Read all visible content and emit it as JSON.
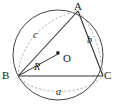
{
  "figure": {
    "type": "geometry-diagram",
    "background_color": "#ffffff",
    "stroke_color": "#3a3a3a",
    "dashed_color": "#9a9a9a",
    "text_color": "#1a1a1a"
  },
  "labels": {
    "vertex_a": "A",
    "vertex_b": "B",
    "vertex_c": "C",
    "center": "O",
    "radius": "R",
    "side_a": "a",
    "side_b": "b",
    "side_c": "c"
  },
  "geometry": {
    "circle": {
      "cx": 58,
      "cy": 55,
      "r": 45
    },
    "points": {
      "A": {
        "x": 78,
        "y": 11
      },
      "B": {
        "x": 18,
        "y": 76
      },
      "C": {
        "x": 103,
        "y": 76
      },
      "O": {
        "x": 58,
        "y": 53
      }
    },
    "solid_segments": [
      {
        "name": "side-AB",
        "from": "A",
        "to": "B"
      },
      {
        "name": "side-AC",
        "from": "A",
        "to": "C"
      },
      {
        "name": "side-BC",
        "from": "B",
        "to": "C"
      },
      {
        "name": "radius-OB",
        "from": "O",
        "to": "B"
      }
    ],
    "dashed_arcs": [
      {
        "name": "arc-c-AB",
        "label": "c"
      },
      {
        "name": "arc-b-AC",
        "label": "b"
      },
      {
        "name": "arc-a-BC",
        "label": "a"
      }
    ]
  }
}
